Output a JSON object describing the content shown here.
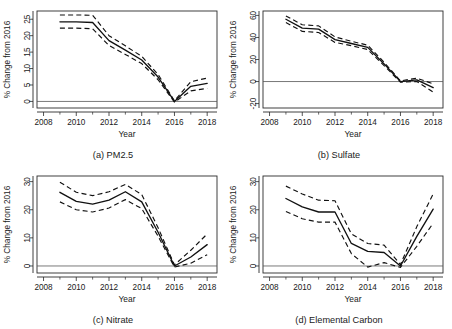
{
  "figure": {
    "background": "#ffffff",
    "line_color": "#111111",
    "zero_line_color": "#555555",
    "panel_count": 4
  },
  "chart_data": [
    {
      "type": "line",
      "title": "(a) PM2.5",
      "xlabel": "Year",
      "ylabel": "% Change from 2016",
      "xlim": [
        2007.6,
        2018.6
      ],
      "ylim": [
        -2.0,
        27.5
      ],
      "xticks": [
        2008,
        2010,
        2012,
        2014,
        2016,
        2018
      ],
      "xtick_labels": [
        "2008",
        "2010",
        "2012",
        "2014",
        "2016",
        "2018"
      ],
      "yticks": [
        0,
        5,
        10,
        15,
        20,
        25
      ],
      "ytick_labels": [
        "0",
        "5",
        "10",
        "15",
        "20",
        "25"
      ],
      "grid": false,
      "legend": "none",
      "zero_reference_line": true,
      "x": [
        2009,
        2010,
        2011,
        2012,
        2013,
        2014,
        2015,
        2016,
        2017,
        2018
      ],
      "series": [
        {
          "name": "Estimate",
          "style": "solid",
          "values": [
            24.2,
            24.2,
            24.0,
            18.5,
            15.6,
            12.6,
            7.4,
            0.0,
            4.6,
            5.5
          ]
        },
        {
          "name": "Upper 95% CI",
          "style": "dashed",
          "values": [
            26.3,
            26.3,
            26.2,
            20.0,
            16.9,
            13.7,
            8.2,
            0.2,
            6.0,
            7.1
          ]
        },
        {
          "name": "Lower 95% CI",
          "style": "dashed",
          "values": [
            22.3,
            22.3,
            22.1,
            17.0,
            14.3,
            11.5,
            6.6,
            -0.2,
            3.2,
            4.0
          ]
        }
      ]
    },
    {
      "type": "line",
      "title": "(b) Sulfate",
      "xlabel": "Year",
      "ylabel": "% Change from 2016",
      "xlim": [
        2007.6,
        2018.6
      ],
      "ylim": [
        -24.0,
        64.0
      ],
      "xticks": [
        2008,
        2010,
        2012,
        2014,
        2016,
        2018
      ],
      "xtick_labels": [
        "2008",
        "2010",
        "2012",
        "2014",
        "2016",
        "2018"
      ],
      "yticks": [
        -20,
        0,
        20,
        40,
        60
      ],
      "ytick_labels": [
        "-20",
        "0",
        "20",
        "40",
        "60"
      ],
      "grid": false,
      "legend": "none",
      "zero_reference_line": true,
      "x": [
        2009,
        2010,
        2011,
        2012,
        2013,
        2014,
        2015,
        2016,
        2017,
        2018
      ],
      "series": [
        {
          "name": "Estimate",
          "style": "solid",
          "values": [
            56.5,
            48.5,
            47.5,
            38.0,
            34.5,
            31.0,
            16.0,
            0.0,
            1.5,
            -5.5
          ]
        },
        {
          "name": "Upper 95% CI",
          "style": "dashed",
          "values": [
            59.5,
            51.5,
            50.5,
            40.5,
            36.5,
            33.0,
            17.5,
            0.6,
            3.0,
            -2.0
          ]
        },
        {
          "name": "Lower 95% CI",
          "style": "dashed",
          "values": [
            53.5,
            45.5,
            44.5,
            35.5,
            32.5,
            29.0,
            14.5,
            -0.6,
            0.0,
            -9.5
          ]
        }
      ]
    },
    {
      "type": "line",
      "title": "(c) Nitrate",
      "xlabel": "Year",
      "ylabel": "% Change from 2016",
      "xlim": [
        2007.6,
        2018.6
      ],
      "ylim": [
        -2.5,
        32.0
      ],
      "xticks": [
        2008,
        2010,
        2012,
        2014,
        2016,
        2018
      ],
      "xtick_labels": [
        "2008",
        "2010",
        "2012",
        "2014",
        "2016",
        "2018"
      ],
      "yticks": [
        0,
        10,
        20,
        30
      ],
      "ytick_labels": [
        "0",
        "10",
        "20",
        "30"
      ],
      "grid": false,
      "legend": "none",
      "zero_reference_line": true,
      "x": [
        2009,
        2010,
        2011,
        2012,
        2013,
        2014,
        2015,
        2016,
        2017,
        2018
      ],
      "series": [
        {
          "name": "Estimate",
          "style": "solid",
          "values": [
            26.2,
            23.0,
            22.0,
            23.4,
            26.4,
            22.8,
            12.0,
            0.0,
            3.2,
            7.6
          ]
        },
        {
          "name": "Upper 95% CI",
          "style": "dashed",
          "values": [
            29.8,
            26.2,
            25.0,
            26.4,
            29.0,
            25.4,
            13.6,
            0.4,
            5.6,
            11.4
          ]
        },
        {
          "name": "Lower 95% CI",
          "style": "dashed",
          "values": [
            22.8,
            20.0,
            19.2,
            20.6,
            23.6,
            20.4,
            10.6,
            -0.4,
            1.0,
            4.0
          ]
        }
      ]
    },
    {
      "type": "line",
      "title": "(d) Elemental Carbon",
      "xlabel": "Year",
      "ylabel": "% Change from 2016",
      "xlim": [
        2007.6,
        2018.6
      ],
      "ylim": [
        -2.5,
        32.0
      ],
      "xticks": [
        2008,
        2010,
        2012,
        2014,
        2016,
        2018
      ],
      "xtick_labels": [
        "2008",
        "2010",
        "2012",
        "2014",
        "2016",
        "2018"
      ],
      "yticks": [
        0,
        10,
        20,
        30
      ],
      "ytick_labels": [
        "0",
        "10",
        "20",
        "30"
      ],
      "grid": false,
      "legend": "none",
      "zero_reference_line": true,
      "x": [
        2009,
        2010,
        2011,
        2012,
        2013,
        2014,
        2015,
        2016,
        2017,
        2018
      ],
      "series": [
        {
          "name": "Estimate",
          "style": "solid",
          "values": [
            24.0,
            21.0,
            19.2,
            19.2,
            8.0,
            5.2,
            4.8,
            0.0,
            10.5,
            20.2
          ]
        },
        {
          "name": "Upper 95% CI",
          "style": "dashed",
          "values": [
            28.4,
            25.6,
            23.4,
            23.2,
            11.4,
            8.0,
            7.4,
            0.5,
            14.0,
            25.6
          ]
        },
        {
          "name": "Lower 95% CI",
          "style": "dashed",
          "values": [
            19.4,
            16.8,
            15.6,
            15.6,
            4.4,
            -0.4,
            1.2,
            -0.5,
            7.0,
            15.2
          ]
        }
      ]
    }
  ]
}
